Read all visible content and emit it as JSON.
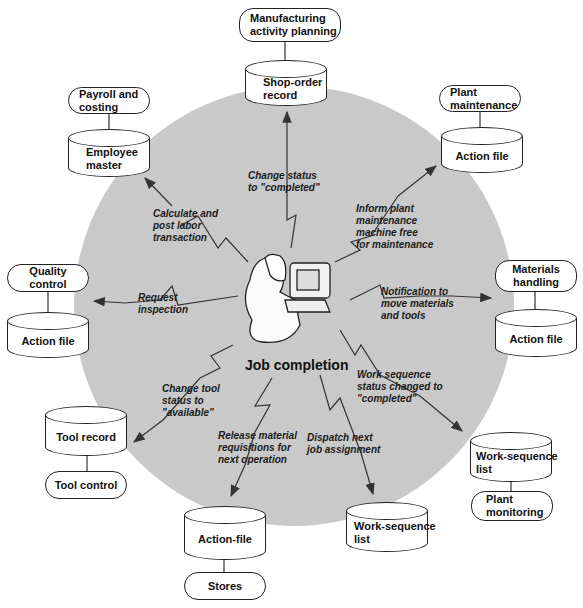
{
  "diagram": {
    "center_title": "Job completion",
    "center_figure": "operator-at-terminal",
    "colors": {
      "circle_fill": "#c9c9c9",
      "box_fill": "#ffffff",
      "stroke": "#222222"
    },
    "nodes": {
      "manufacturing": {
        "function": "Manufacturing\nactivity planning",
        "file": "Shop-order\nrecord",
        "message": "Change status\nto \"completed\""
      },
      "payroll": {
        "function": "Payroll and\ncosting",
        "file": "Employee\nmaster",
        "message": "Calculate and\npost labor\ntransaction"
      },
      "plant_maintenance": {
        "function": "Plant\nmaintenance",
        "file": "Action file",
        "message": "Inform plant\nmaintenance\nmachine free\nfor maintenance"
      },
      "quality": {
        "function": "Quality\ncontrol",
        "file": "Action file",
        "message": "Request\ninspection"
      },
      "materials": {
        "function": "Materials\nhandling",
        "file": "Action file",
        "message": "Notification to\nmove materials\nand tools"
      },
      "tool": {
        "function": "Tool control",
        "file": "Tool record",
        "message": "Change tool\nstatus to\n\"available\""
      },
      "plant_monitoring": {
        "function": "Plant\nmonitoring",
        "file": "Work-sequence\nlist",
        "message": "Work sequence\nstatus changed to\n\"completed\""
      },
      "stores": {
        "function": "Stores",
        "file": "Action-file",
        "message": "Release material\nrequisitions for\nnext operation"
      },
      "dispatch": {
        "file": "Work-sequence\nlist",
        "message": "Dispatch next\njob assignment"
      }
    }
  }
}
